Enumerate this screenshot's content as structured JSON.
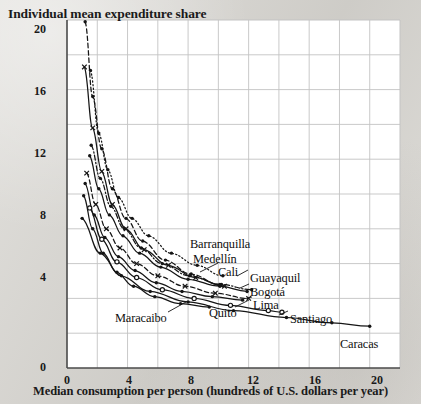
{
  "chart_data": {
    "type": "line",
    "title": "Individual mean expenditure share",
    "xlabel": "Median consumption per person (hundreds of U.S. dollars per year)",
    "ylabel": "Individual mean expenditure share",
    "xlim": [
      0,
      22
    ],
    "ylim": [
      0,
      20
    ],
    "xticks": [
      0,
      4,
      8,
      12,
      16,
      20
    ],
    "yticks": [
      0,
      4,
      8,
      12,
      16,
      20
    ],
    "grid": true,
    "grid_step_x": 2,
    "grid_step_y": 2,
    "legend": "none",
    "annotations": [
      "Barranquilla",
      "Medellin",
      "Cali",
      "Guayaquil",
      "Bogota",
      "Lima",
      "Quito",
      "Maracaibo",
      "Santiago",
      "Caracas"
    ],
    "series": [
      {
        "name": "Barranquilla",
        "style": "dotted",
        "marker": "dot",
        "points": [
          [
            1.55,
            17.1
          ],
          [
            2.1,
            13.5
          ],
          [
            2.7,
            11.4
          ],
          [
            3.4,
            9.8
          ],
          [
            4.3,
            8.6
          ],
          [
            5.4,
            7.6
          ],
          [
            6.9,
            6.6
          ],
          [
            8.6,
            5.9
          ],
          [
            10.3,
            5.3
          ]
        ]
      },
      {
        "name": "Medellin",
        "style": "dashed",
        "marker": "dot",
        "points": [
          [
            1.2,
            19.9
          ],
          [
            1.7,
            15.6
          ],
          [
            2.3,
            12.6
          ],
          [
            3.0,
            10.3
          ],
          [
            3.9,
            8.6
          ],
          [
            5.0,
            7.3
          ],
          [
            6.5,
            6.2
          ],
          [
            8.2,
            5.4
          ],
          [
            10.1,
            4.8
          ]
        ]
      },
      {
        "name": "Cali",
        "style": "solid",
        "marker": "cross",
        "points": [
          [
            1.15,
            17.3
          ],
          [
            1.7,
            13.8
          ],
          [
            2.3,
            11.3
          ],
          [
            3.0,
            9.4
          ],
          [
            3.9,
            8.0
          ],
          [
            5.1,
            6.8
          ],
          [
            6.7,
            5.9
          ],
          [
            8.5,
            5.2
          ],
          [
            10.4,
            4.7
          ]
        ]
      },
      {
        "name": "Guayaquil",
        "style": "dashdot",
        "marker": "dot",
        "points": [
          [
            1.6,
            12.8
          ],
          [
            2.2,
            10.9
          ],
          [
            2.9,
            9.3
          ],
          [
            3.8,
            8.0
          ],
          [
            4.9,
            6.9
          ],
          [
            6.3,
            6.0
          ],
          [
            8.1,
            5.3
          ],
          [
            10.2,
            4.8
          ],
          [
            12.2,
            4.5
          ]
        ]
      },
      {
        "name": "Bogota",
        "style": "solid",
        "marker": "dot",
        "points": [
          [
            1.5,
            12.2
          ],
          [
            2.1,
            10.3
          ],
          [
            2.8,
            8.8
          ],
          [
            3.7,
            7.6
          ],
          [
            4.8,
            6.6
          ],
          [
            6.2,
            5.8
          ],
          [
            8.0,
            5.1
          ],
          [
            10.1,
            4.7
          ],
          [
            11.9,
            4.4
          ]
        ]
      },
      {
        "name": "Lima",
        "style": "dashed",
        "marker": "cross",
        "points": [
          [
            1.3,
            11.2
          ],
          [
            1.9,
            9.4
          ],
          [
            2.6,
            8.0
          ],
          [
            3.5,
            6.9
          ],
          [
            4.6,
            6.0
          ],
          [
            6.0,
            5.3
          ],
          [
            7.8,
            4.7
          ],
          [
            9.8,
            4.3
          ],
          [
            12.0,
            4.0
          ]
        ]
      },
      {
        "name": "Quito",
        "style": "solid",
        "marker": "dot",
        "points": [
          [
            1.2,
            10.6
          ],
          [
            1.8,
            8.8
          ],
          [
            2.5,
            7.5
          ],
          [
            3.4,
            6.4
          ],
          [
            4.5,
            5.6
          ],
          [
            5.9,
            4.9
          ],
          [
            7.6,
            4.4
          ],
          [
            9.6,
            4.1
          ],
          [
            11.6,
            3.9
          ]
        ]
      },
      {
        "name": "Maracaibo",
        "style": "solid",
        "marker": "dot",
        "points": [
          [
            1.1,
            9.9
          ],
          [
            1.7,
            8.0
          ],
          [
            2.4,
            6.6
          ],
          [
            3.3,
            5.5
          ],
          [
            4.4,
            4.7
          ],
          [
            5.8,
            4.1
          ],
          [
            7.5,
            3.7
          ],
          [
            9.4,
            3.5
          ]
        ]
      },
      {
        "name": "Santiago",
        "style": "solid",
        "marker": "circle",
        "points": [
          [
            1.5,
            9.2
          ],
          [
            2.3,
            7.4
          ],
          [
            3.3,
            6.1
          ],
          [
            4.6,
            5.2
          ],
          [
            6.3,
            4.5
          ],
          [
            8.4,
            4.0
          ],
          [
            10.8,
            3.6
          ],
          [
            13.3,
            3.3
          ],
          [
            14.2,
            3.2
          ]
        ]
      },
      {
        "name": "Caracas",
        "style": "solid",
        "marker": "dot",
        "points": [
          [
            1.0,
            8.6
          ],
          [
            2.2,
            6.6
          ],
          [
            3.6,
            5.3
          ],
          [
            5.5,
            4.4
          ],
          [
            8.0,
            3.8
          ],
          [
            11.0,
            3.3
          ],
          [
            14.5,
            2.9
          ],
          [
            17.5,
            2.6
          ],
          [
            20.0,
            2.4
          ]
        ]
      }
    ]
  },
  "labels": {
    "barranquilla": "Barranquilla",
    "medellin": "Medellín",
    "cali": "Cali",
    "guayaquil": "Guayaquil",
    "bogota": "Bogotá",
    "lima": "Lima",
    "quito": "Quito",
    "maracaibo": "Maracaibo",
    "santiago": "Santiago",
    "caracas": "Caracas"
  },
  "axes": {
    "title": "Individual mean expenditure share",
    "xlabel": "Median consumption per person (hundreds of U.S. dollars per year)",
    "y_ticks": [
      "20",
      "16",
      "12",
      "8",
      "4",
      "0"
    ],
    "x_ticks": [
      "0",
      "4",
      "8",
      "12",
      "16",
      "20"
    ]
  },
  "colors": {
    "paper": "#d9d7d2",
    "plot_background": "#ffffff",
    "ink": "#1a1a1a",
    "grid": "#c3c3c3",
    "axis": "#555555"
  }
}
